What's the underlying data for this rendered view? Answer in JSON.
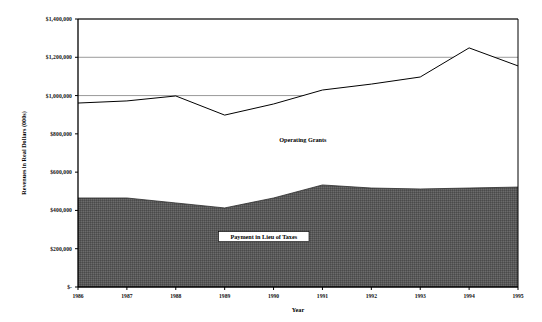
{
  "chart_data": {
    "type": "area",
    "stacked": true,
    "title": "",
    "subtitle": "",
    "xlabel": "Year",
    "ylabel": "Revenues in Real Dollars (000s)",
    "categories": [
      "1986",
      "1987",
      "1988",
      "1989",
      "1990",
      "1991",
      "1992",
      "1993",
      "1994",
      "1995"
    ],
    "x": [
      1986,
      1987,
      1988,
      1989,
      1990,
      1991,
      1992,
      1993,
      1994,
      1995
    ],
    "series": [
      {
        "name": "Payment in Lieu of Taxes",
        "color": "#595959",
        "values": [
          465000,
          465000,
          439000,
          413000,
          465000,
          533000,
          517000,
          512000,
          517000,
          522000
        ]
      },
      {
        "name": "Operating Grants",
        "color": "#ffffff",
        "values": [
          496000,
          507000,
          559000,
          485000,
          491000,
          496000,
          543000,
          585000,
          732000,
          633000
        ]
      }
    ],
    "totals": [
      961000,
      972000,
      998000,
      898000,
      956000,
      1029000,
      1060000,
      1097000,
      1249000,
      1155000
    ],
    "ylim": [
      0,
      1400000
    ],
    "yticks": [
      0,
      200000,
      400000,
      600000,
      800000,
      1000000,
      1200000,
      1400000
    ],
    "ytick_labels": [
      "$-",
      "$200,000",
      "$400,000",
      "$600,000",
      "$800,000",
      "$1,000,000",
      "$1,200,000",
      "$1,400,000"
    ],
    "grid": "horizontal",
    "gridlines_visible_at": [
      1000000,
      1200000,
      1400000
    ],
    "legend_position": "inline-annotation",
    "annotations": [
      {
        "name": "operating-grants-label",
        "text": "Operating Grants",
        "x": 1990.6,
        "y": 760000
      },
      {
        "name": "payment-in-lieu-label",
        "text": "Payment in Lieu of Taxes",
        "x": 1989.8,
        "y": 250000,
        "boxed": true
      }
    ]
  },
  "axes": {
    "y_title": "Revenues in Real Dollars (000s)",
    "x_title": "Year",
    "y_labels": [
      "$1,400,000",
      "$1,200,000",
      "$1,000,000",
      "$800,000",
      "$600,000",
      "$400,000",
      "$200,000",
      "$-"
    ],
    "x_labels": [
      "1986",
      "1987",
      "1988",
      "1989",
      "1990",
      "1991",
      "1992",
      "1993",
      "1994",
      "1995"
    ]
  },
  "labels": {
    "operating_grants": "Operating Grants",
    "payment_in_lieu_of_taxes": "Payment in Lieu of Taxes"
  },
  "colors": {
    "lower_area": "#595959",
    "upper_area": "#ffffff",
    "line": "#000000",
    "gridline": "#808080",
    "axis": "#000000",
    "background": "#ffffff"
  }
}
